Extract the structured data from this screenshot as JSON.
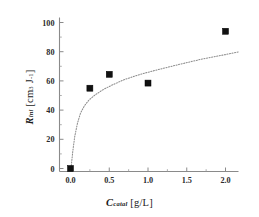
{
  "chart_data": {
    "type": "scatter",
    "title": "",
    "xlabel": "C_catal [g/L]",
    "ylabel": "R_ini [cm3 J-1]",
    "xlim": [
      -0.25,
      2.3
    ],
    "ylim": [
      -12,
      112
    ],
    "grid": false,
    "legend": null,
    "xticks": [
      "0.0",
      "0.5",
      "1.0",
      "1.5",
      "2.0"
    ],
    "xtick_values": [
      0.0,
      0.5,
      1.0,
      1.5,
      2.0
    ],
    "yticks": [
      "0",
      "20",
      "40",
      "60",
      "80",
      "100"
    ],
    "ytick_values": [
      0,
      20,
      40,
      60,
      80,
      100
    ],
    "x": [
      0.0,
      0.25,
      0.5,
      1.0,
      2.0
    ],
    "values": [
      0,
      55,
      64.5,
      58.5,
      94
    ],
    "series": [
      {
        "name": "measured",
        "marker": "filled-square",
        "color": "#111111",
        "points": [
          {
            "x": 0.0,
            "y": 0
          },
          {
            "x": 0.25,
            "y": 55
          },
          {
            "x": 0.5,
            "y": 64.5
          },
          {
            "x": 1.0,
            "y": 58.5
          },
          {
            "x": 2.0,
            "y": 94
          }
        ]
      },
      {
        "name": "fit-curve",
        "style": "dotted",
        "color": "#8d8d8d",
        "points": [
          {
            "x": 0.01,
            "y": 2
          },
          {
            "x": 0.03,
            "y": 12
          },
          {
            "x": 0.055,
            "y": 22
          },
          {
            "x": 0.09,
            "y": 31
          },
          {
            "x": 0.13,
            "y": 38
          },
          {
            "x": 0.18,
            "y": 43
          },
          {
            "x": 0.24,
            "y": 47
          },
          {
            "x": 0.32,
            "y": 50.5
          },
          {
            "x": 0.42,
            "y": 54
          },
          {
            "x": 0.55,
            "y": 57.5
          },
          {
            "x": 0.7,
            "y": 61
          },
          {
            "x": 0.9,
            "y": 64.5
          },
          {
            "x": 1.15,
            "y": 68
          },
          {
            "x": 1.42,
            "y": 71.5
          },
          {
            "x": 1.7,
            "y": 75
          },
          {
            "x": 2.0,
            "y": 78
          },
          {
            "x": 2.18,
            "y": 80
          }
        ]
      }
    ]
  },
  "axes": {
    "x_label_parts": {
      "symbol": "C",
      "sub": "catal",
      "unit": "[g/L]"
    },
    "y_label_parts": {
      "symbol": "R",
      "sub": "ini",
      "unit_open": "[cm",
      "unit_sup1": "3",
      "unit_mid": " J",
      "unit_sup2": "-1",
      "unit_close": "]"
    }
  },
  "colors": {
    "marker": "#111111",
    "curve": "#8d8d8d",
    "axis": "#8a8a8a",
    "background": "#ffffff"
  }
}
